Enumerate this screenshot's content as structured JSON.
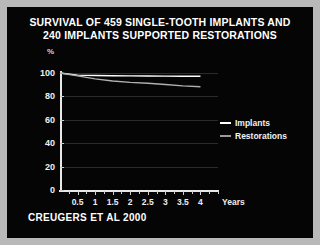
{
  "slide": {
    "title_line1": "SURVIVAL OF 459 SINGLE-TOOTH IMPLANTS AND",
    "title_line2": "240 IMPLANTS SUPPORTED RESTORATIONS",
    "footer": "CREUGERS ET AL 2000",
    "background_color": "#050505",
    "border_color": "#b9b9b9",
    "text_color": "#ffffff"
  },
  "chart_data": {
    "type": "line",
    "title": "SURVIVAL OF 459 SINGLE-TOOTH IMPLANTS AND 240 IMPLANTS SUPPORTED RESTORATIONS",
    "xlabel": "Years",
    "ylabel": "%",
    "unit_label": "%",
    "x": [
      0,
      0.5,
      1,
      1.5,
      2,
      2.5,
      3,
      3.5,
      4
    ],
    "xlim": [
      0,
      4.5
    ],
    "ylim": [
      0,
      100
    ],
    "xticks": [
      0.5,
      1,
      1.5,
      2,
      2.5,
      3,
      3.5,
      4
    ],
    "xtick_labels": [
      "0.5",
      "1",
      "1.5",
      "2",
      "2.5",
      "3",
      "3.5",
      "4"
    ],
    "xminor_step": 0.25,
    "yticks": [
      0,
      20,
      40,
      60,
      80,
      100
    ],
    "ytick_labels": [
      "0",
      "20",
      "40",
      "60",
      "80",
      "100"
    ],
    "grid": true,
    "grid_axis": "y",
    "legend_position": "right",
    "series": [
      {
        "name": "Implants",
        "color": "#ffffff",
        "values": [
          100,
          98.2,
          97.8,
          97.6,
          97.5,
          97.4,
          97.3,
          97.2,
          97.2
        ]
      },
      {
        "name": "Restorations",
        "color": "#b0b0b0",
        "values": [
          100,
          97.5,
          95.0,
          93.2,
          92.0,
          91.2,
          90.2,
          89.0,
          88.2
        ]
      }
    ]
  },
  "legend": {
    "items": [
      {
        "label": "Implants",
        "color": "#ffffff"
      },
      {
        "label": "Restorations",
        "color": "#9a9a9a"
      }
    ]
  }
}
